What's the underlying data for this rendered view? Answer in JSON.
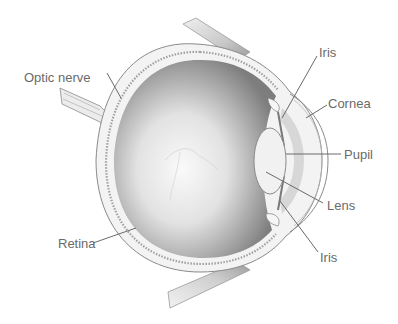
{
  "diagram": {
    "colors": {
      "background": "#ffffff",
      "label_text": "#6a6a6a",
      "leader_line": "#6a6a6a",
      "outline": "#8a8a8a",
      "interior_dark": "#7a7a7a",
      "interior_light": "#f4f4f4"
    },
    "labels": [
      {
        "id": "optic-nerve",
        "text": "Optic nerve"
      },
      {
        "id": "iris-top",
        "text": "Iris"
      },
      {
        "id": "cornea",
        "text": "Cornea"
      },
      {
        "id": "pupil",
        "text": "Pupil"
      },
      {
        "id": "lens",
        "text": "Lens"
      },
      {
        "id": "iris-bottom",
        "text": "Iris"
      },
      {
        "id": "retina",
        "text": "Retina"
      }
    ]
  }
}
